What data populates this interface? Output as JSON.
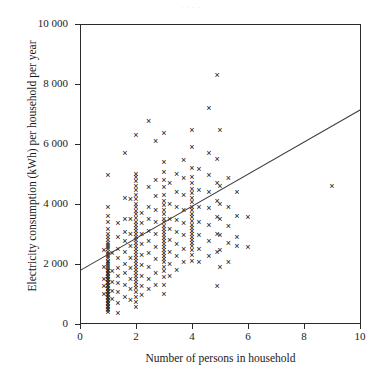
{
  "figure": {
    "ghost_title": "  .    .  .    .  ",
    "axes": {
      "x": {
        "label": "Number of persons in household",
        "ticks": [
          0,
          2,
          4,
          6,
          8,
          10
        ],
        "min": 0,
        "max": 10
      },
      "y": {
        "label": "Electricity consumption (kWh) per household per year",
        "tick_labels": [
          "0",
          "2 000",
          "4 000",
          "6 000",
          "8 000",
          "10 000"
        ],
        "ticks": [
          0,
          2000,
          4000,
          6000,
          8000,
          10000
        ],
        "min": 0,
        "max": 10000
      }
    },
    "marker": "x",
    "marker_color": "#111111",
    "line_color": "#3a3a3a"
  },
  "chart_data": {
    "type": "scatter",
    "title": "",
    "xlabel": "Number of persons in household",
    "ylabel": "Electricity consumption (kWh) per household per year",
    "xlim": [
      0,
      10
    ],
    "ylim": [
      0,
      10000
    ],
    "xticks": [
      0,
      2,
      4,
      6,
      8,
      10
    ],
    "yticks": [
      0,
      2000,
      4000,
      6000,
      8000,
      10000
    ],
    "grid": false,
    "legend": null,
    "marker": "x",
    "series": [
      {
        "name": "households",
        "points": [
          [
            1.0,
            4950
          ],
          [
            1.0,
            3900
          ],
          [
            1.0,
            3600
          ],
          [
            1.0,
            3400
          ],
          [
            1.0,
            3150
          ],
          [
            1.0,
            3000
          ],
          [
            1.0,
            2900
          ],
          [
            1.0,
            2800
          ],
          [
            1.0,
            2700
          ],
          [
            1.0,
            2620
          ],
          [
            1.0,
            2550
          ],
          [
            1.0,
            2480
          ],
          [
            1.0,
            2400
          ],
          [
            1.0,
            2320
          ],
          [
            1.0,
            2250
          ],
          [
            1.0,
            2180
          ],
          [
            1.0,
            2100
          ],
          [
            1.0,
            2050
          ],
          [
            1.0,
            1980
          ],
          [
            1.0,
            1920
          ],
          [
            1.0,
            1850
          ],
          [
            1.0,
            1800
          ],
          [
            1.0,
            1750
          ],
          [
            1.0,
            1700
          ],
          [
            1.0,
            1650
          ],
          [
            1.0,
            1600
          ],
          [
            1.0,
            1550
          ],
          [
            1.0,
            1500
          ],
          [
            1.0,
            1450
          ],
          [
            1.0,
            1400
          ],
          [
            1.0,
            1350
          ],
          [
            1.0,
            1300
          ],
          [
            1.0,
            1250
          ],
          [
            1.0,
            1200
          ],
          [
            1.0,
            1150
          ],
          [
            1.0,
            1100
          ],
          [
            1.0,
            1050
          ],
          [
            1.0,
            1000
          ],
          [
            1.0,
            950
          ],
          [
            1.0,
            900
          ],
          [
            1.0,
            850
          ],
          [
            1.0,
            800
          ],
          [
            1.0,
            750
          ],
          [
            1.0,
            700
          ],
          [
            1.0,
            650
          ],
          [
            1.0,
            600
          ],
          [
            1.0,
            550
          ],
          [
            1.0,
            500
          ],
          [
            1.0,
            450
          ],
          [
            1.0,
            400
          ],
          [
            0.85,
            2450
          ],
          [
            0.85,
            1900
          ],
          [
            0.85,
            1500
          ],
          [
            0.85,
            1250
          ],
          [
            0.85,
            980
          ],
          [
            1.15,
            2350
          ],
          [
            1.15,
            1750
          ],
          [
            1.15,
            1400
          ],
          [
            1.15,
            1100
          ],
          [
            1.15,
            820
          ],
          [
            1.35,
            3350
          ],
          [
            1.35,
            2900
          ],
          [
            1.35,
            2500
          ],
          [
            1.35,
            2200
          ],
          [
            1.35,
            1850
          ],
          [
            1.35,
            1600
          ],
          [
            1.35,
            1350
          ],
          [
            1.35,
            1050
          ],
          [
            1.35,
            700
          ],
          [
            1.35,
            350
          ],
          [
            1.6,
            5700
          ],
          [
            1.6,
            4200
          ],
          [
            1.6,
            3500
          ],
          [
            1.6,
            3050
          ],
          [
            1.6,
            2750
          ],
          [
            1.6,
            2400
          ],
          [
            1.6,
            2000
          ],
          [
            1.6,
            1700
          ],
          [
            1.6,
            1300
          ],
          [
            1.6,
            900
          ],
          [
            2.0,
            6300
          ],
          [
            2.0,
            5000
          ],
          [
            2.0,
            4900
          ],
          [
            2.0,
            4750
          ],
          [
            2.0,
            4600
          ],
          [
            2.0,
            4450
          ],
          [
            2.0,
            4300
          ],
          [
            2.0,
            4150
          ],
          [
            2.0,
            4000
          ],
          [
            2.0,
            3880
          ],
          [
            2.0,
            3760
          ],
          [
            2.0,
            3640
          ],
          [
            2.0,
            3520
          ],
          [
            2.0,
            3400
          ],
          [
            2.0,
            3300
          ],
          [
            2.0,
            3200
          ],
          [
            2.0,
            3100
          ],
          [
            2.0,
            3000
          ],
          [
            2.0,
            2900
          ],
          [
            2.0,
            2800
          ],
          [
            2.0,
            2700
          ],
          [
            2.0,
            2600
          ],
          [
            2.0,
            2500
          ],
          [
            2.0,
            2400
          ],
          [
            2.0,
            2300
          ],
          [
            2.0,
            2200
          ],
          [
            2.0,
            2100
          ],
          [
            2.0,
            2000
          ],
          [
            2.0,
            1900
          ],
          [
            2.0,
            1800
          ],
          [
            2.0,
            1700
          ],
          [
            2.0,
            1600
          ],
          [
            2.0,
            1500
          ],
          [
            2.0,
            1400
          ],
          [
            2.0,
            1300
          ],
          [
            2.0,
            1200
          ],
          [
            2.0,
            1050
          ],
          [
            2.0,
            900
          ],
          [
            2.0,
            720
          ],
          [
            2.0,
            560
          ],
          [
            1.8,
            4150
          ],
          [
            1.8,
            3500
          ],
          [
            1.8,
            3000
          ],
          [
            1.8,
            2600
          ],
          [
            1.8,
            2200
          ],
          [
            1.8,
            1850
          ],
          [
            1.8,
            1500
          ],
          [
            1.8,
            1150
          ],
          [
            1.8,
            800
          ],
          [
            2.2,
            3700
          ],
          [
            2.2,
            3350
          ],
          [
            2.2,
            3000
          ],
          [
            2.2,
            2650
          ],
          [
            2.2,
            2300
          ],
          [
            2.2,
            1950
          ],
          [
            2.2,
            1600
          ],
          [
            2.2,
            1250
          ],
          [
            2.2,
            950
          ],
          [
            2.45,
            6750
          ],
          [
            2.45,
            4550
          ],
          [
            2.45,
            3900
          ],
          [
            2.45,
            3500
          ],
          [
            2.45,
            3100
          ],
          [
            2.45,
            2750
          ],
          [
            2.45,
            2350
          ],
          [
            2.45,
            1900
          ],
          [
            2.45,
            1500
          ],
          [
            2.45,
            1150
          ],
          [
            2.7,
            6100
          ],
          [
            2.7,
            4800
          ],
          [
            2.7,
            4250
          ],
          [
            2.7,
            3800
          ],
          [
            2.7,
            3400
          ],
          [
            2.7,
            3000
          ],
          [
            2.7,
            2550
          ],
          [
            2.7,
            2150
          ],
          [
            2.7,
            1700
          ],
          [
            2.7,
            1300
          ],
          [
            3.0,
            6350
          ],
          [
            3.0,
            5400
          ],
          [
            3.0,
            5050
          ],
          [
            3.0,
            4800
          ],
          [
            3.0,
            4550
          ],
          [
            3.0,
            4300
          ],
          [
            3.0,
            4100
          ],
          [
            3.0,
            3950
          ],
          [
            3.0,
            3800
          ],
          [
            3.0,
            3650
          ],
          [
            3.0,
            3500
          ],
          [
            3.0,
            3380
          ],
          [
            3.0,
            3260
          ],
          [
            3.0,
            3150
          ],
          [
            3.0,
            3050
          ],
          [
            3.0,
            2950
          ],
          [
            3.0,
            2850
          ],
          [
            3.0,
            2750
          ],
          [
            3.0,
            2650
          ],
          [
            3.0,
            2550
          ],
          [
            3.0,
            2450
          ],
          [
            3.0,
            2350
          ],
          [
            3.0,
            2250
          ],
          [
            3.0,
            2150
          ],
          [
            3.0,
            2050
          ],
          [
            3.0,
            1900
          ],
          [
            3.0,
            1750
          ],
          [
            3.0,
            1550
          ],
          [
            3.0,
            1300
          ],
          [
            3.0,
            1000
          ],
          [
            3.2,
            4700
          ],
          [
            3.2,
            4000
          ],
          [
            3.2,
            3500
          ],
          [
            3.2,
            3150
          ],
          [
            3.2,
            2800
          ],
          [
            3.2,
            2400
          ],
          [
            3.2,
            2000
          ],
          [
            3.2,
            1600
          ],
          [
            3.45,
            5000
          ],
          [
            3.45,
            4400
          ],
          [
            3.45,
            3900
          ],
          [
            3.45,
            3450
          ],
          [
            3.45,
            3050
          ],
          [
            3.45,
            2650
          ],
          [
            3.45,
            2250
          ],
          [
            3.45,
            1800
          ],
          [
            3.7,
            5450
          ],
          [
            3.7,
            4850
          ],
          [
            3.7,
            4300
          ],
          [
            3.7,
            3800
          ],
          [
            3.7,
            3350
          ],
          [
            3.7,
            2950
          ],
          [
            3.7,
            2500
          ],
          [
            3.7,
            2050
          ],
          [
            4.0,
            6450
          ],
          [
            4.0,
            5900
          ],
          [
            4.0,
            5200
          ],
          [
            4.0,
            4900
          ],
          [
            4.0,
            4700
          ],
          [
            4.0,
            4500
          ],
          [
            4.0,
            4350
          ],
          [
            4.0,
            4200
          ],
          [
            4.0,
            4050
          ],
          [
            4.0,
            3900
          ],
          [
            4.0,
            3780
          ],
          [
            4.0,
            3660
          ],
          [
            4.0,
            3540
          ],
          [
            4.0,
            3420
          ],
          [
            4.0,
            3300
          ],
          [
            4.0,
            3200
          ],
          [
            4.0,
            3100
          ],
          [
            4.0,
            3000
          ],
          [
            4.0,
            2900
          ],
          [
            4.0,
            2800
          ],
          [
            4.0,
            2700
          ],
          [
            4.0,
            2600
          ],
          [
            4.0,
            2450
          ],
          [
            4.0,
            2300
          ],
          [
            4.0,
            2100
          ],
          [
            4.25,
            5150
          ],
          [
            4.25,
            4450
          ],
          [
            4.25,
            3900
          ],
          [
            4.25,
            3400
          ],
          [
            4.25,
            2950
          ],
          [
            4.25,
            2500
          ],
          [
            4.25,
            2050
          ],
          [
            4.6,
            7200
          ],
          [
            4.6,
            5700
          ],
          [
            4.6,
            4950
          ],
          [
            4.6,
            4400
          ],
          [
            4.6,
            3850
          ],
          [
            4.6,
            3300
          ],
          [
            4.6,
            2750
          ],
          [
            4.6,
            2250
          ],
          [
            4.9,
            8300
          ],
          [
            4.9,
            5500
          ],
          [
            4.9,
            4700
          ],
          [
            4.9,
            4100
          ],
          [
            4.9,
            3550
          ],
          [
            4.9,
            3000
          ],
          [
            4.9,
            2400
          ],
          [
            4.9,
            1250
          ],
          [
            5.0,
            6450
          ],
          [
            5.0,
            4600
          ],
          [
            5.0,
            4000
          ],
          [
            5.0,
            3500
          ],
          [
            5.0,
            2950
          ],
          [
            5.0,
            2450
          ],
          [
            5.0,
            1900
          ],
          [
            5.3,
            4850
          ],
          [
            5.3,
            3900
          ],
          [
            5.3,
            3250
          ],
          [
            5.3,
            2700
          ],
          [
            5.3,
            2050
          ],
          [
            5.6,
            4400
          ],
          [
            5.6,
            3600
          ],
          [
            5.6,
            2900
          ],
          [
            5.6,
            2600
          ],
          [
            6.0,
            3550
          ],
          [
            6.0,
            2550
          ],
          [
            9.0,
            4600
          ]
        ]
      }
    ],
    "trendline": {
      "name": "linear fit",
      "x0": 0.0,
      "y0": 1800,
      "x1": 10.0,
      "y1": 7150
    }
  }
}
